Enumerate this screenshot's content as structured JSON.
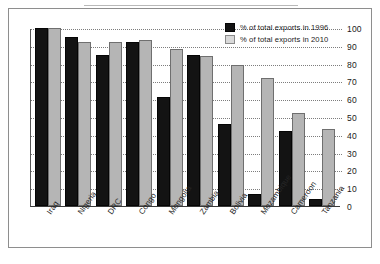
{
  "chart_data": {
    "type": "bar",
    "title": "",
    "subtitle": "",
    "xlabel": "",
    "ylabel": "",
    "ylim": [
      0,
      100
    ],
    "ytick_step": 10,
    "yticks": [
      100,
      90,
      80,
      70,
      60,
      50,
      40,
      30,
      20,
      10,
      0
    ],
    "grid": true,
    "grid_style": "dotted-horizontal",
    "y_axis_position": "right",
    "legend_position": "top-right-inside",
    "x_label_rotation_deg": -55,
    "categories": [
      "Iraq",
      "Nigeria",
      "DRC",
      "Congo",
      "Mongolia",
      "Zambia",
      "Bolivia",
      "Mozambique",
      "Cameroon",
      "Tanzania"
    ],
    "series": [
      {
        "name": "% of total exports in 1996",
        "color": "#131313",
        "values": [
          100,
          95,
          85,
          92,
          61,
          85,
          46,
          7,
          42,
          4
        ]
      },
      {
        "name": "% of total exports in 2010",
        "color": "#b5b5b5",
        "values": [
          100,
          92,
          92,
          93,
          88,
          84,
          79,
          72,
          52,
          43
        ]
      }
    ]
  },
  "legend": {
    "items": [
      {
        "label": "% of total exports in 1996",
        "swatch": "black-square-icon"
      },
      {
        "label": "% of total exports in 2010",
        "swatch": "gray-square-icon"
      }
    ]
  }
}
